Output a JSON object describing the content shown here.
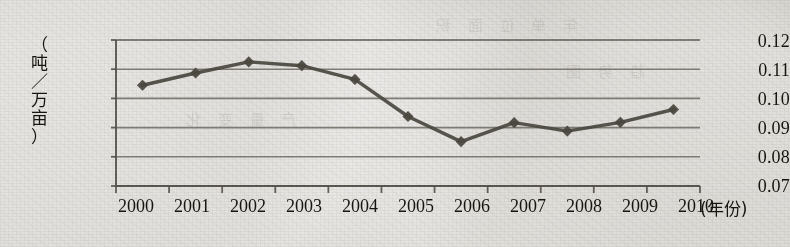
{
  "chart_data": {
    "type": "line",
    "title": "",
    "subtitle": "",
    "xlabel": "(年份)",
    "ylabel": "（吨／万亩）",
    "ylabel_chars": [
      "（",
      "吨",
      "／",
      "万",
      "亩",
      "）"
    ],
    "categories": [
      "2000",
      "2001",
      "2002",
      "2003",
      "2004",
      "2005",
      "2006",
      "2007",
      "2008",
      "2009",
      "2010"
    ],
    "values": [
      0.1045,
      0.1087,
      0.1125,
      0.1112,
      0.1065,
      0.0938,
      0.0852,
      0.0917,
      0.0888,
      0.0918,
      0.0962
    ],
    "ylim": [
      0.07,
      0.12
    ],
    "yticks": [
      0.12,
      0.11,
      0.1,
      0.09,
      0.08,
      0.07
    ],
    "ytick_labels": [
      "0.12",
      "0.11",
      "0.10",
      "0.09",
      "0.08",
      "0.07"
    ],
    "grid": true,
    "grid_axis": "y",
    "legend": false,
    "legend_position": "none",
    "series": [
      {
        "name": "",
        "marker": "diamond",
        "color": "#4a4740",
        "values": [
          0.1045,
          0.1087,
          0.1125,
          0.1112,
          0.1065,
          0.0938,
          0.0852,
          0.0917,
          0.0888,
          0.0918,
          0.0962
        ]
      }
    ],
    "annotations": []
  },
  "colors": {
    "paper": "#d6d3cb",
    "ink": "#17150f",
    "grid": "#6e6b64",
    "axis": "#55524b",
    "series": "#4a4740"
  },
  "bleed_through": [
    "年 单 位 面 积",
    "产 量 变 化",
    "趋 势 图"
  ]
}
